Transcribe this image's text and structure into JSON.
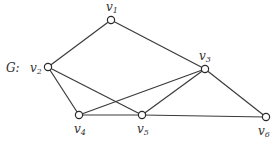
{
  "graph": {
    "name": "G:",
    "nodes": [
      {
        "id": "v1",
        "label": "v",
        "sub": "1",
        "x": 111,
        "y": 20,
        "lx": 106,
        "ly": 11
      },
      {
        "id": "v2",
        "label": "v",
        "sub": "2",
        "x": 48,
        "y": 67,
        "lx": 30,
        "ly": 72
      },
      {
        "id": "v3",
        "label": "v",
        "sub": "3",
        "x": 205,
        "y": 69,
        "lx": 199,
        "ly": 60
      },
      {
        "id": "v4",
        "label": "v",
        "sub": "4",
        "x": 79,
        "y": 115,
        "lx": 74,
        "ly": 133
      },
      {
        "id": "v5",
        "label": "v",
        "sub": "5",
        "x": 142,
        "y": 115,
        "lx": 137,
        "ly": 133
      },
      {
        "id": "v6",
        "label": "v",
        "sub": "6",
        "x": 266,
        "y": 117,
        "lx": 258,
        "ly": 135
      }
    ],
    "edges": [
      [
        "v1",
        "v2"
      ],
      [
        "v1",
        "v3"
      ],
      [
        "v2",
        "v4"
      ],
      [
        "v2",
        "v5"
      ],
      [
        "v3",
        "v4"
      ],
      [
        "v3",
        "v5"
      ],
      [
        "v3",
        "v6"
      ],
      [
        "v4",
        "v5"
      ],
      [
        "v5",
        "v6"
      ]
    ]
  }
}
